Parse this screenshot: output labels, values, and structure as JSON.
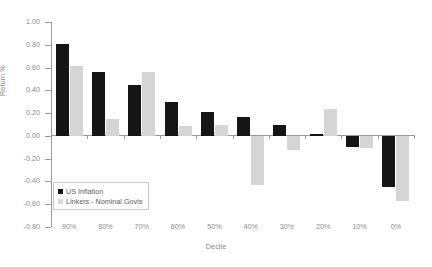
{
  "chart_data": {
    "type": "bar",
    "title": "",
    "xlabel": "Decile",
    "ylabel": "Return %",
    "categories": [
      "90%",
      "80%",
      "70%",
      "60%",
      "50%",
      "40%",
      "30%",
      "20%",
      "10%",
      "0%"
    ],
    "series": [
      {
        "name": "US Inflation",
        "color": "#151515",
        "values": [
          0.81,
          0.56,
          0.45,
          0.3,
          0.21,
          0.17,
          0.1,
          0.02,
          -0.1,
          -0.45
        ]
      },
      {
        "name": "Linkers - Nominal Govis",
        "color": "#d5d5d5",
        "values": [
          0.61,
          0.15,
          0.56,
          0.09,
          0.1,
          -0.43,
          -0.12,
          0.24,
          -0.11,
          -0.57
        ]
      }
    ],
    "ylim": [
      -0.8,
      1.0
    ],
    "ytick_values": [
      1.0,
      0.8,
      0.6,
      0.4,
      0.2,
      0.0,
      -0.2,
      -0.4,
      -0.6,
      -0.8
    ],
    "ytick_labels": [
      "1.00",
      "0.80",
      "0.60",
      "0.40",
      "0.20",
      "0.00",
      "-0.20",
      "-0.40",
      "-0.60",
      "-0.80"
    ],
    "grid": false,
    "legend_position": "lower-left"
  }
}
